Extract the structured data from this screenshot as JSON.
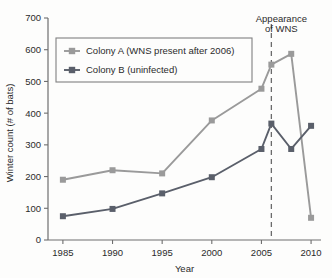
{
  "chart_data": {
    "type": "line",
    "title": "",
    "xlabel": "Year",
    "ylabel": "Winter count (# of bats)",
    "xlim": [
      1983.5,
      2011
    ],
    "ylim": [
      0,
      700
    ],
    "xticks": [
      1985,
      1990,
      1995,
      2000,
      2005,
      2010
    ],
    "xtick_labels": [
      "1985",
      "1990",
      "1995",
      "2000",
      "2005",
      "2010"
    ],
    "yticks": [
      0,
      100,
      200,
      300,
      400,
      500,
      600,
      700
    ],
    "ytick_labels": [
      "0",
      "100",
      "200",
      "300",
      "400",
      "500",
      "600",
      "700"
    ],
    "grid": false,
    "legend_position": "upper left",
    "series": [
      {
        "name": "Colony A (WNS present after 2006)",
        "color": "#9a9a9a",
        "marker": "square",
        "x": [
          1985,
          1990,
          1995,
          2000,
          2005,
          2006,
          2008,
          2010
        ],
        "values": [
          190,
          220,
          210,
          377,
          477,
          553,
          587,
          70
        ]
      },
      {
        "name": "Colony B (uninfected)",
        "color": "#5a5f6a",
        "marker": "square",
        "x": [
          1985,
          1990,
          1995,
          2000,
          2005,
          2006,
          2008,
          2010
        ],
        "values": [
          75,
          98,
          147,
          198,
          287,
          367,
          287,
          360
        ]
      }
    ],
    "annotations": [
      {
        "name": "appearance-of-wns",
        "text_line1": "Appearance",
        "text_line2": "of WNS",
        "x": 2006,
        "style": "dashed-vertical-line"
      }
    ]
  }
}
